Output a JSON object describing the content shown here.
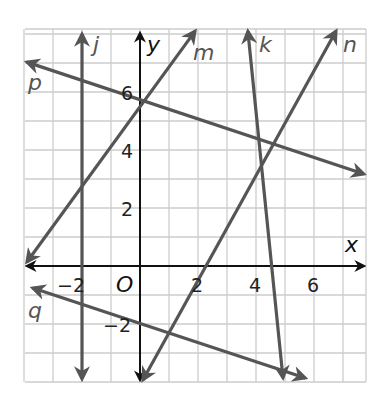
{
  "chart_data": {
    "type": "line",
    "title": "",
    "xlabel": "x",
    "ylabel": "y",
    "origin_label": "O",
    "xlim": [
      -4,
      7.8
    ],
    "ylim": [
      -4,
      8.1
    ],
    "grid": true,
    "grid_step": 1,
    "x_tick_labels": [
      {
        "value": -2,
        "label": "−2"
      },
      {
        "value": 2,
        "label": "2"
      },
      {
        "value": 4,
        "label": "4"
      },
      {
        "value": 6,
        "label": "6"
      }
    ],
    "y_tick_labels": [
      {
        "value": 6,
        "label": "6"
      },
      {
        "value": 4,
        "label": "4"
      },
      {
        "value": 2,
        "label": "2"
      },
      {
        "value": -2,
        "label": "−2"
      }
    ],
    "series": [
      {
        "name": "j",
        "kind": "vertical",
        "x": -2,
        "from": [
          -2,
          8.0
        ],
        "to": [
          -2,
          -3.9
        ]
      },
      {
        "name": "m",
        "from": [
          -3.9,
          0.14
        ],
        "to": [
          1.9,
          8.1
        ]
      },
      {
        "name": "p",
        "from": [
          -3.9,
          7.03
        ],
        "to": [
          7.72,
          3.17
        ]
      },
      {
        "name": "k",
        "from": [
          3.72,
          8.1
        ],
        "to": [
          4.93,
          -3.86
        ]
      },
      {
        "name": "n",
        "from": [
          0.1,
          -3.93
        ],
        "to": [
          6.76,
          8.1
        ]
      },
      {
        "name": "q",
        "from": [
          -3.7,
          -0.76
        ],
        "to": [
          5.7,
          -3.86
        ]
      }
    ],
    "line_color": "#555555",
    "axis_color": "#111111",
    "grid_color": "#cccccc"
  },
  "labels": {
    "j": "j",
    "y": "y",
    "m": "m",
    "k": "k",
    "n": "n",
    "p": "p",
    "q": "q",
    "x": "x",
    "O": "O",
    "xtick_m2": "−2",
    "xtick_2": "2",
    "xtick_4": "4",
    "xtick_6": "6",
    "ytick_6": "6",
    "ytick_4": "4",
    "ytick_2": "2",
    "ytick_m2": "−2"
  }
}
